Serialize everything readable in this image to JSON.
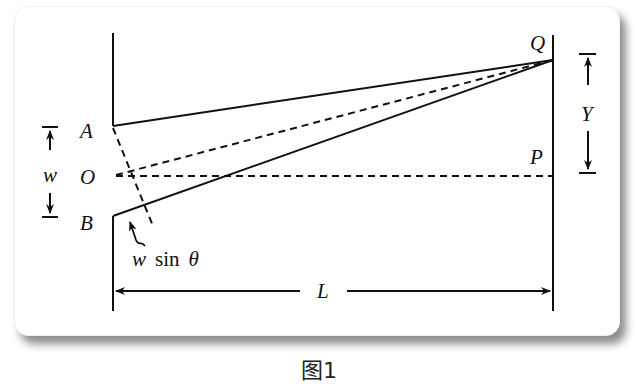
{
  "figure": {
    "caption": "图1",
    "labels": {
      "A": "A",
      "O": "O",
      "B": "B",
      "Q": "Q",
      "P": "P",
      "w": "w",
      "Y": "Y",
      "L": "L",
      "path_diff_var": "w",
      "path_diff_func": "sin",
      "path_diff_angle": "θ"
    }
  }
}
